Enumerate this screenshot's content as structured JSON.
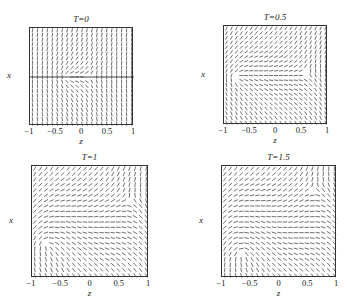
{
  "chart_data": [
    {
      "type": "vector_field",
      "title": "T=0",
      "xlabel": "z",
      "ylabel": "x",
      "xlim": [
        -1,
        1
      ],
      "ylim": [
        -1,
        1
      ],
      "xticks": [
        "-1",
        "-0.5",
        "0",
        "0.5",
        "1"
      ],
      "yticks": [
        "1",
        "0.5",
        "0",
        "-0.5",
        "-1"
      ],
      "defects": [
        {
          "z": -0.3,
          "x": 0.0,
          "charge": 0.5
        },
        {
          "z": 0.15,
          "x": 0.0,
          "charge": -0.5
        }
      ],
      "twist": 0.0,
      "frame": {
        "left": 29,
        "top": 27,
        "width": 104,
        "height": 98
      }
    },
    {
      "type": "vector_field",
      "title": "T=0.5",
      "xlabel": "z",
      "ylabel": "x",
      "xlim": [
        -1,
        1
      ],
      "ylim": [
        -1,
        1
      ],
      "xticks": [
        "-1",
        "-0.5",
        "0",
        "0.5",
        "1"
      ],
      "yticks": [
        "1",
        "0.5",
        "0",
        "-0.5",
        "-1"
      ],
      "defects": [
        {
          "z": -0.75,
          "x": -0.05,
          "charge": 0.5
        },
        {
          "z": 0.6,
          "x": 0.05,
          "charge": -0.5
        }
      ],
      "twist": 0.35,
      "frame": {
        "left": 223,
        "top": 25,
        "width": 104,
        "height": 99
      }
    },
    {
      "type": "vector_field",
      "title": "T=1",
      "xlabel": "z",
      "ylabel": "x",
      "xlim": [
        -1,
        1
      ],
      "ylim": [
        -1,
        1
      ],
      "xticks": [
        "-1",
        "-0.5",
        "0",
        "0.5",
        "1"
      ],
      "yticks": [
        "1",
        "0.5",
        "0",
        "-0.5",
        "-1"
      ],
      "defects": [
        {
          "z": -0.75,
          "x": -0.4,
          "charge": 0.5
        },
        {
          "z": 0.65,
          "x": 0.4,
          "charge": -0.5
        }
      ],
      "twist": 0.7,
      "frame": {
        "left": 31,
        "top": 165,
        "width": 117,
        "height": 112
      }
    },
    {
      "type": "vector_field",
      "title": "T=1.5",
      "xlabel": "z",
      "ylabel": "x",
      "xlim": [
        -1,
        1
      ],
      "ylim": [
        -1,
        1
      ],
      "xticks": [
        "-1",
        "-0.5",
        "0",
        "0.5",
        "1"
      ],
      "yticks": [
        "1",
        "0.5",
        "0",
        "-0.5",
        "-1"
      ],
      "defects": [
        {
          "z": -0.65,
          "x": -0.55,
          "charge": 0.5
        },
        {
          "z": 0.6,
          "x": 0.6,
          "charge": -0.5
        }
      ],
      "twist": 1.0,
      "frame": {
        "left": 221,
        "top": 165,
        "width": 115,
        "height": 112
      }
    }
  ],
  "colors": {
    "line": "#333333",
    "background": "#ffffff",
    "frame": "#333333"
  }
}
